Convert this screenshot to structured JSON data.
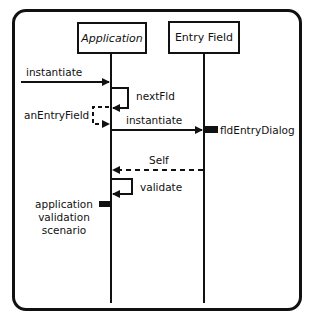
{
  "diagram": {
    "type": "sequence-diagram",
    "colors": {
      "line": "#111111",
      "background": "#ffffff"
    },
    "lifelines": [
      {
        "id": "application",
        "label": "Application"
      },
      {
        "id": "entry_field",
        "label": "Entry Field"
      }
    ],
    "messages": [
      {
        "label": "instantiate",
        "from": "external",
        "to": "application",
        "style": "solid"
      },
      {
        "label": "nextFld",
        "from": "application",
        "to": "application",
        "style": "solid-self"
      },
      {
        "label": "anEntryField",
        "from": "application",
        "to": "application",
        "style": "dashed-return"
      },
      {
        "label": "instantiate",
        "from": "application",
        "to": "entry_field",
        "style": "solid"
      },
      {
        "label": "Self",
        "from": "entry_field",
        "to": "application",
        "style": "dashed-return"
      },
      {
        "label": "validate",
        "from": "application",
        "to": "application",
        "style": "solid-self"
      }
    ],
    "activations": [
      {
        "on": "entry_field",
        "label": "fldEntryDialog"
      },
      {
        "on": "application",
        "label": "application validation scenario"
      }
    ],
    "scenario_lines": [
      "application",
      "validation",
      "scenario"
    ]
  }
}
